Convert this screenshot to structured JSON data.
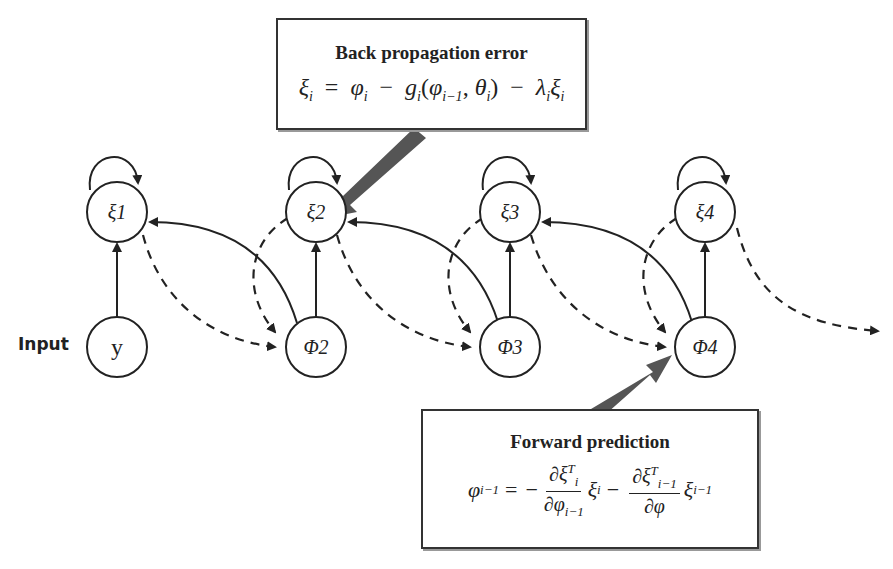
{
  "top_box": {
    "title": "Back propagation error",
    "equation_text": "ξ_i = φ_i − g_i(φ_{i−1}, θ_i) − λ_i ξ_i",
    "eq": {
      "lhs": "ξ",
      "lhs_sub": "i",
      "eq": "=",
      "t1": "φ",
      "t1_sub": "i",
      "minus1": "−",
      "g": "g",
      "g_sub": "i",
      "open": "(",
      "a1": "φ",
      "a1_sub": "i−1",
      "comma": ", ",
      "a2": "θ",
      "a2_sub": "i",
      "close": ")",
      "minus2": "−",
      "lam": "λ",
      "lam_sub": "i",
      "xi": "ξ",
      "xi_sub": "i"
    }
  },
  "bottom_box": {
    "title": "Forward prediction",
    "equation_text": "φ_{i−1} = −(∂ξ_i^T/∂φ_{i−1}) ξ_i − (∂ξ_{i−1}^T/∂φ) ξ_{i−1}",
    "eq": {
      "lhs": "φ",
      "lhs_sub": "i−1",
      "eq": "=",
      "neg": "−",
      "n1": "∂ξ",
      "n1_sub": "i",
      "n1_sup": "T",
      "d1": "∂φ",
      "d1_sub": "i−1",
      "x1": "ξ",
      "x1_sub": "i",
      "minus": "−",
      "n2": "∂ξ",
      "n2_sub": "i−1",
      "n2_sup": "T",
      "d2": "∂φ",
      "x2": "ξ",
      "x2_sub": "i−1"
    }
  },
  "input_label": "Input",
  "nodes": {
    "xi1": "ξ1",
    "xi2": "ξ2",
    "xi3": "ξ3",
    "xi4": "ξ4",
    "y": "y",
    "phi2": "Φ2",
    "phi3": "Φ3",
    "phi4": "Φ4"
  },
  "colors": {
    "stroke": "#222222",
    "pointer_arrow": "#555555",
    "box_border": "#333333"
  }
}
